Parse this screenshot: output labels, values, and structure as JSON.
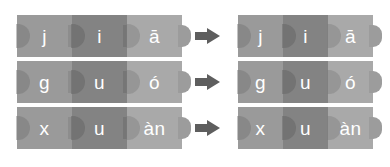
{
  "diagram": {
    "type": "puzzle-assembly",
    "colors": {
      "background": "#ffffff",
      "initial_tile": "#9a9a9a",
      "medial_tile": "#838383",
      "final_tile": "#a9a9a9",
      "tab_shadow": "#7c7c7c",
      "arrow": "#5e5e5e",
      "glyph": "#ffffff"
    },
    "column_labels": [
      "initial",
      "medial",
      "final"
    ],
    "rows": [
      {
        "id": "row-1",
        "pieces": [
          {
            "text": "j",
            "role": "initial"
          },
          {
            "text": "i",
            "role": "medial"
          },
          {
            "text": "ā",
            "role": "final"
          }
        ],
        "arrow": "right-arrow",
        "result": {
          "text": "jiā",
          "segments": [
            "j",
            "i",
            "ā"
          ]
        }
      },
      {
        "id": "row-2",
        "pieces": [
          {
            "text": "g",
            "role": "initial"
          },
          {
            "text": "u",
            "role": "medial"
          },
          {
            "text": "ó",
            "role": "final"
          }
        ],
        "arrow": "right-arrow",
        "result": {
          "text": "guó",
          "segments": [
            "g",
            "u",
            "ó"
          ]
        }
      },
      {
        "id": "row-3",
        "pieces": [
          {
            "text": "x",
            "role": "initial"
          },
          {
            "text": "u",
            "role": "medial"
          },
          {
            "text": "àn",
            "role": "final"
          }
        ],
        "arrow": "right-arrow",
        "result": {
          "text": "xuàn",
          "segments": [
            "x",
            "u",
            "àn"
          ]
        }
      }
    ]
  }
}
